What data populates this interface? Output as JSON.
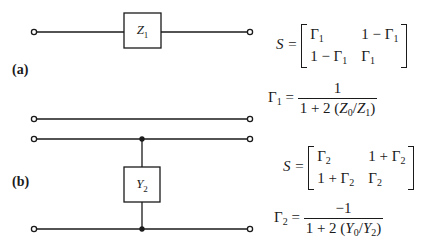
{
  "panels": {
    "a": {
      "label": "(a)",
      "component": {
        "symbol": "Z",
        "subscript": "1",
        "type": "series-impedance"
      },
      "s_matrix": {
        "lhs": "S =",
        "cells": [
          [
            "Γ1",
            "1 − Γ1"
          ],
          [
            "1 − Γ1",
            "Γ1"
          ]
        ],
        "cell_parts": [
          [
            {
              "pre": "",
              "sym": "Γ",
              "sub": "1"
            },
            {
              "pre": "1 − ",
              "sym": "Γ",
              "sub": "1"
            }
          ],
          [
            {
              "pre": "1 − ",
              "sym": "Γ",
              "sub": "1"
            },
            {
              "pre": "",
              "sym": "Γ",
              "sub": "1"
            }
          ]
        ]
      },
      "gamma_eq": {
        "lhs_sym": "Γ",
        "lhs_sub": "1",
        "eq": "=",
        "numerator": "1",
        "den_pre": "1 + 2 (",
        "den_a_sym": "Z",
        "den_a_sub": "0",
        "den_slash": "/",
        "den_b_sym": "Z",
        "den_b_sub": "1",
        "den_post": ")"
      }
    },
    "b": {
      "label": "(b)",
      "component": {
        "symbol": "Y",
        "subscript": "2",
        "type": "shunt-admittance"
      },
      "s_matrix": {
        "lhs": "S =",
        "cell_parts": [
          [
            {
              "pre": "",
              "sym": "Γ",
              "sub": "2"
            },
            {
              "pre": "1 + ",
              "sym": "Γ",
              "sub": "2"
            }
          ],
          [
            {
              "pre": "1 + ",
              "sym": "Γ",
              "sub": "2"
            },
            {
              "pre": "",
              "sym": "Γ",
              "sub": "2"
            }
          ]
        ]
      },
      "gamma_eq": {
        "lhs_sym": "Γ",
        "lhs_sub": "2",
        "eq": "=",
        "numerator": "−1",
        "den_pre": "1 + 2 (",
        "den_a_sym": "Y",
        "den_a_sub": "0",
        "den_slash": "/",
        "den_b_sym": "Y",
        "den_b_sub": "2",
        "den_post": ")"
      }
    }
  },
  "colors": {
    "ink": "#1a1a1a",
    "background": "#ffffff"
  }
}
